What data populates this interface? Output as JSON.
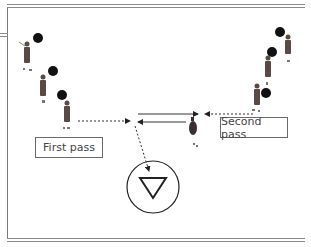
{
  "diagram": {
    "labels": {
      "first_pass": "First pass",
      "second_pass": "Second pass"
    },
    "elements": {
      "left_players": 3,
      "right_players": 3,
      "balls_left": 3,
      "balls_right": 3,
      "center_player": 1,
      "goal_symbol": "triangle-in-circle"
    },
    "colors": {
      "frame": "#8a8a8a",
      "ball": "#111111",
      "player": "#5a4a45",
      "arrow": "#222222",
      "text": "#444444"
    }
  }
}
